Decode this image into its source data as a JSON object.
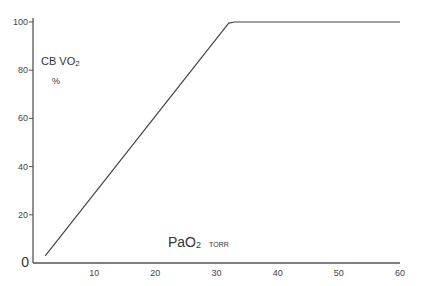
{
  "chart_data": {
    "type": "line",
    "title": "",
    "xlabel": "PaO2",
    "xlabel_main": "PaO",
    "xlabel_sub": "2",
    "xunit": "TORR",
    "ylabel": "CB VO2",
    "ylabel_main": "CB VO",
    "ylabel_sub": "2",
    "yunit": "%",
    "xlim": [
      0,
      60
    ],
    "ylim": [
      0,
      100
    ],
    "xticks": [
      10,
      20,
      30,
      40,
      50,
      60
    ],
    "yticks": [
      0,
      20,
      40,
      60,
      80,
      100
    ],
    "grid": false,
    "legend": null,
    "series": [
      {
        "name": "CB VO2",
        "x": [
          2,
          32,
          33,
          60
        ],
        "y": [
          3,
          99.5,
          100,
          100
        ]
      }
    ]
  }
}
